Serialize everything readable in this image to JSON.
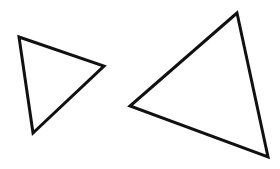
{
  "canvas": {
    "width": 280,
    "height": 169,
    "background": "#ffffff"
  },
  "stroke": {
    "color": "#111111",
    "width": 3
  },
  "shapes": [
    {
      "name": "small-triangle",
      "type": "triangle",
      "points": "19,37 104,66 33,133"
    },
    {
      "name": "large-triangle",
      "type": "triangle",
      "points": "237,13 130,106 268,157"
    }
  ]
}
